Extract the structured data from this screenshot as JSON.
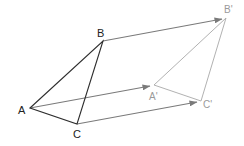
{
  "diagram": {
    "colors": {
      "original": "#2e2e2e",
      "image": "#a8a8a8",
      "arrows": "#7a7a7a",
      "label_original": "#222222",
      "label_image": "#9a9a9a"
    },
    "points": {
      "A": {
        "label": "A",
        "x": 30,
        "y": 108
      },
      "B": {
        "label": "B",
        "x": 103,
        "y": 41
      },
      "C": {
        "label": "C",
        "x": 77,
        "y": 124
      },
      "A_prime": {
        "label": "A",
        "prime": "'",
        "x": 154,
        "y": 85
      },
      "B_prime": {
        "label": "B",
        "prime": "'",
        "x": 226,
        "y": 18
      },
      "C_prime": {
        "label": "C",
        "prime": "'",
        "x": 201,
        "y": 101
      }
    },
    "labels": [
      {
        "id": "A",
        "text": "A"
      },
      {
        "id": "B",
        "text": "B"
      },
      {
        "id": "C",
        "text": "C"
      },
      {
        "id": "A_prime",
        "text": "A'"
      },
      {
        "id": "B_prime",
        "text": "B'"
      },
      {
        "id": "C_prime",
        "text": "C'"
      }
    ],
    "translation_vectors": [
      {
        "from": "A",
        "to": "A'"
      },
      {
        "from": "B",
        "to": "B'"
      },
      {
        "from": "C",
        "to": "C'"
      }
    ]
  }
}
